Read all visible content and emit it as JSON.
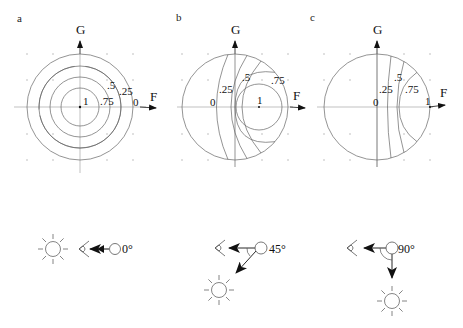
{
  "panels": [
    {
      "id": "a",
      "letter": "a",
      "axis_x_label": "F",
      "axis_y_label": "G",
      "contour_labels": {
        "c0": "0",
        "c25": ".25",
        "c5": ".5",
        "c75": ".75",
        "c1": "1"
      },
      "angle_label": "0°"
    },
    {
      "id": "b",
      "letter": "b",
      "axis_x_label": "F",
      "axis_y_label": "G",
      "contour_labels": {
        "c0": "0",
        "c25": ".25",
        "c5": ".5",
        "c75": ".75",
        "c1": "1"
      },
      "angle_label": "45°"
    },
    {
      "id": "c",
      "letter": "c",
      "axis_x_label": "F",
      "axis_y_label": "G",
      "contour_labels": {
        "c0": "0",
        "c25": ".25",
        "c5": ".5",
        "c75": ".75",
        "c1": "1"
      },
      "angle_label": "90°"
    }
  ],
  "colors": {
    "line": "#666666",
    "axis": "#999999",
    "ink": "#111111",
    "background": "#ffffff"
  }
}
